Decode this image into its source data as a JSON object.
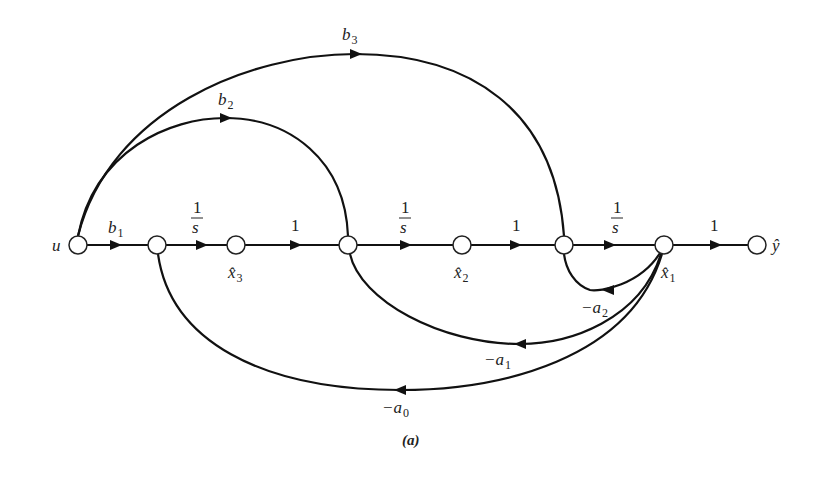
{
  "figure": {
    "caption": "(a)",
    "type": "signal flow graph"
  },
  "nodes": [
    {
      "id": "u",
      "label": "u",
      "x": 78,
      "y": 245
    },
    {
      "id": "n1",
      "label": "",
      "x": 157,
      "y": 245
    },
    {
      "id": "x3",
      "label": "x̂",
      "sub": "3",
      "x": 236,
      "y": 245
    },
    {
      "id": "n2",
      "label": "",
      "x": 348,
      "y": 245
    },
    {
      "id": "x2",
      "label": "x̂",
      "sub": "2",
      "x": 462,
      "y": 245
    },
    {
      "id": "n3",
      "label": "",
      "x": 564,
      "y": 245
    },
    {
      "id": "x1",
      "label": "x̂",
      "sub": "1",
      "x": 664,
      "y": 245
    },
    {
      "id": "y",
      "label": "ŷ",
      "x": 757,
      "y": 245
    }
  ],
  "edges": {
    "b1": {
      "from": "u",
      "to": "n1",
      "base": "b",
      "sub": "1"
    },
    "s1": {
      "from": "n1",
      "to": "x3",
      "num": "1",
      "den": "s"
    },
    "one1": {
      "from": "x3",
      "to": "n2",
      "label": "1"
    },
    "s2": {
      "from": "n2",
      "to": "x2",
      "num": "1",
      "den": "s"
    },
    "one2": {
      "from": "x2",
      "to": "n3",
      "label": "1"
    },
    "s3": {
      "from": "n3",
      "to": "x1",
      "num": "1",
      "den": "s"
    },
    "one3": {
      "from": "x1",
      "to": "y",
      "label": "1"
    },
    "b2": {
      "from": "u",
      "to": "n2",
      "base": "b",
      "sub": "2"
    },
    "b3": {
      "from": "u",
      "to": "n3",
      "base": "b",
      "sub": "3"
    },
    "a2": {
      "from": "x1",
      "to": "n3",
      "base": "−a",
      "sub": "2"
    },
    "a1": {
      "from": "x1",
      "to": "n2",
      "base": "−a",
      "sub": "1"
    },
    "a0": {
      "from": "x1",
      "to": "n1",
      "base": "−a",
      "sub": "0"
    }
  },
  "colors": {
    "stroke": "#111111",
    "background": "#ffffff"
  }
}
